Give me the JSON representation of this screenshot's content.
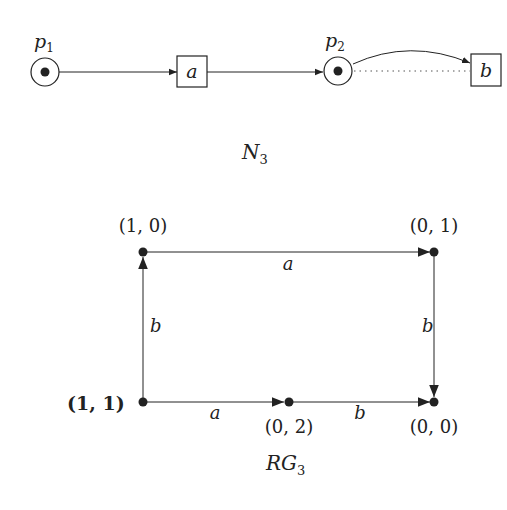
{
  "net": {
    "caption_main": "N",
    "caption_sub": "3",
    "places": [
      {
        "id": "p1",
        "label_main": "p",
        "label_sub": "1",
        "tokens": 1
      },
      {
        "id": "p2",
        "label_main": "p",
        "label_sub": "2",
        "tokens": 1
      }
    ],
    "transitions": [
      {
        "id": "a",
        "label": "a"
      },
      {
        "id": "b",
        "label": "b"
      }
    ],
    "arcs": [
      {
        "from": "p1",
        "to": "a",
        "style": "solid"
      },
      {
        "from": "a",
        "to": "p2",
        "style": "solid"
      },
      {
        "from": "p2",
        "to": "b",
        "style": "curved"
      },
      {
        "from": "p2",
        "to": "b",
        "style": "dotted"
      }
    ]
  },
  "reachability_graph": {
    "caption_main": "RG",
    "caption_sub": "3",
    "nodes": [
      {
        "id": "n11",
        "label": "(1, 1)",
        "initial": true
      },
      {
        "id": "n10",
        "label": "(1, 0)"
      },
      {
        "id": "n01",
        "label": "(0, 1)"
      },
      {
        "id": "n02",
        "label": "(0, 2)"
      },
      {
        "id": "n00",
        "label": "(0, 0)"
      }
    ],
    "edges": [
      {
        "from": "n11",
        "to": "n10",
        "label": "b"
      },
      {
        "from": "n10",
        "to": "n01",
        "label": "a"
      },
      {
        "from": "n01",
        "to": "n00",
        "label": "b"
      },
      {
        "from": "n11",
        "to": "n02",
        "label": "a"
      },
      {
        "from": "n02",
        "to": "n00",
        "label": "b"
      }
    ]
  },
  "colors": {
    "ink": "#222222",
    "background": "#ffffff"
  }
}
